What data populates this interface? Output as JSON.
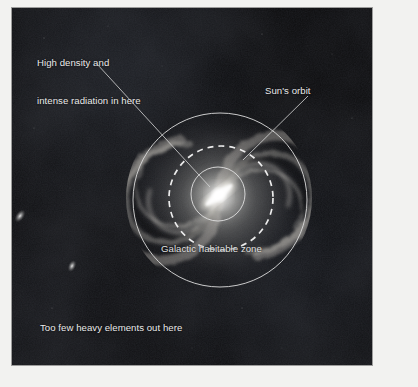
{
  "figure": {
    "kind": "astronomy-diagram",
    "background_color": "#040405",
    "annotation_color": "#ebebeb",
    "border_color": "#f2f2f0"
  },
  "annotations": {
    "high_density": {
      "line1": "High density and",
      "line2": "intense radiation in here",
      "leader_from": [
        85,
        56
      ],
      "leader_to": [
        198,
        179
      ]
    },
    "suns_orbit": {
      "label": "Sun's orbit",
      "leader_from": [
        296,
        88
      ],
      "leader_to": [
        231,
        152
      ]
    },
    "habitable_zone": {
      "label": "Galactic habitable zone"
    },
    "too_few_elements": {
      "label": "Too few heavy elements out here"
    }
  },
  "geometry": {
    "outer_circle": {
      "name": "galactic-habitable-zone-boundary",
      "cx": 208,
      "cy": 192,
      "r": 87,
      "style": "solid",
      "stroke": "#d8d8d8"
    },
    "dashed_circle": {
      "name": "suns-orbit",
      "cx": 209,
      "cy": 190,
      "r": 52,
      "style": "dashed",
      "stroke": "#f0f0f0"
    },
    "inner_circle": {
      "name": "high-density-core-boundary",
      "cx": 206,
      "cy": 186,
      "r": 27,
      "style": "solid",
      "stroke": "#dcdcdc"
    },
    "galaxy": {
      "name": "milky-way-spiral",
      "cx": 207,
      "cy": 190,
      "r": 92,
      "bar_angle_deg": -38
    },
    "satellites": [
      {
        "name": "satellite-galaxy-upper",
        "cx": 20,
        "cy": 216,
        "rx": 4,
        "ry": 7,
        "angle_deg": 35
      },
      {
        "name": "satellite-galaxy-lower",
        "cx": 72,
        "cy": 266,
        "rx": 4,
        "ry": 6,
        "angle_deg": 25
      }
    ]
  }
}
